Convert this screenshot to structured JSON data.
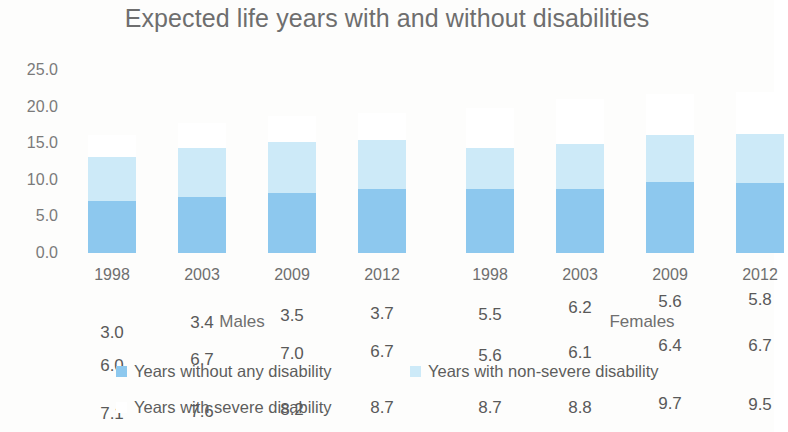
{
  "chart_data": {
    "type": "bar",
    "subtype": "stacked",
    "title": "Expected life years with and without disabilities",
    "xlabel": "",
    "ylabel": "",
    "ylim": [
      0,
      25
    ],
    "ytick_step": 5,
    "ytick_labels": [
      "25.0",
      "20.0",
      "15.0",
      "10.0",
      "5.0",
      "0.0"
    ],
    "ytick_values": [
      25.0,
      20.0,
      15.0,
      10.0,
      5.0,
      0.0
    ],
    "grid": false,
    "legend_position": "bottom",
    "categories": [
      "1998",
      "2003",
      "2009",
      "2012",
      "1998",
      "2003",
      "2009",
      "2012"
    ],
    "groups": [
      {
        "label": "Males",
        "categories": [
          "1998",
          "2003",
          "2009",
          "2012"
        ]
      },
      {
        "label": "Females",
        "categories": [
          "1998",
          "2003",
          "2009",
          "2012"
        ]
      }
    ],
    "series": [
      {
        "name": "Years without any disability",
        "color": "#8DC8EE",
        "values": [
          7.1,
          7.6,
          8.2,
          8.7,
          8.7,
          8.8,
          9.7,
          9.5
        ],
        "labels": [
          "7.1",
          "7.6",
          "8.2",
          "8.7",
          "8.7",
          "8.8",
          "9.7",
          "9.5"
        ]
      },
      {
        "name": "Years with non-severe disability",
        "color": "#CDEAF8",
        "values": [
          6.0,
          6.7,
          7.0,
          6.7,
          5.6,
          6.1,
          6.4,
          6.7
        ],
        "labels": [
          "6.0",
          "6.7",
          "7.0",
          "6.7",
          "5.6",
          "6.1",
          "6.4",
          "6.7"
        ]
      },
      {
        "name": "Years with severe disability",
        "color": "#FFFFFF",
        "values": [
          3.0,
          3.4,
          3.5,
          3.7,
          5.5,
          6.2,
          5.6,
          5.8
        ],
        "labels": [
          "3.0",
          "3.4",
          "3.5",
          "3.7",
          "5.5",
          "6.2",
          "5.6",
          "5.8"
        ]
      }
    ]
  },
  "legend": {
    "items": [
      {
        "label": "Years without any disability",
        "color": "#8DC8EE"
      },
      {
        "label": "Years with non-severe disability",
        "color": "#CDEAF8"
      },
      {
        "label": "Years with severe disability",
        "color": "#FFFFFF"
      }
    ]
  }
}
